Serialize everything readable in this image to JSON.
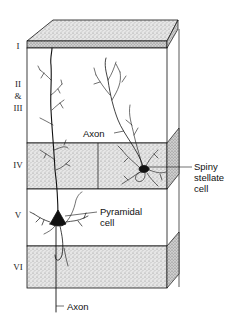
{
  "figure": {
    "type": "cortical-layers-block-diagram",
    "layers": [
      {
        "id": "I",
        "label": "I"
      },
      {
        "id": "II-III",
        "label_lines": [
          "II",
          "&",
          "III"
        ]
      },
      {
        "id": "IV",
        "label": "IV"
      },
      {
        "id": "V",
        "label": "V"
      },
      {
        "id": "VI",
        "label": "VI"
      }
    ],
    "annotations": {
      "stellate_axon": "Axon",
      "stellate_cell_line1": "Spiny",
      "stellate_cell_line2": "stellate",
      "stellate_cell_line3": "cell",
      "pyramidal_cell_line1": "Pyramidal",
      "pyramidal_cell_line2": "cell",
      "pyramidal_axon": "Axon"
    },
    "colors": {
      "ink": "#111111",
      "stipple": "#c9c9c9",
      "background": "#ffffff"
    }
  }
}
